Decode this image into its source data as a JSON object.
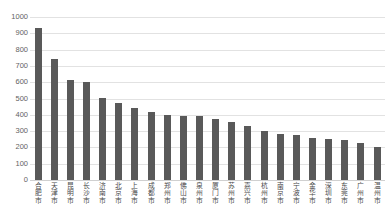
{
  "chart_data": {
    "type": "bar",
    "title": "",
    "subtitle": "",
    "xlabel": "",
    "ylabel": "",
    "ylim": [
      0,
      1000
    ],
    "grid": true,
    "legend": false,
    "legend_position": "none",
    "bar_color": "#595959",
    "gridline_color": "#e2e2e2",
    "yticks": [
      1000,
      900,
      800,
      700,
      600,
      500,
      400,
      300,
      200,
      100,
      0
    ],
    "ytick_labels": [
      "1000",
      "900",
      "800",
      "700",
      "600",
      "500",
      "400",
      "300",
      "200",
      "100",
      "0"
    ],
    "categories": [
      "合肥市",
      "天津市",
      "昆明市",
      "长沙市",
      "济南市",
      "北京市",
      "上海市",
      "成都市",
      "郑州市",
      "佛山市",
      "泉州市",
      "厦门市",
      "苏州市",
      "嘉兴市",
      "杭州市",
      "南京市",
      "宁波市",
      "金华市",
      "深圳市",
      "东莞市",
      "广州市",
      "温州市"
    ],
    "values": [
      935,
      745,
      612,
      600,
      505,
      470,
      440,
      420,
      400,
      395,
      390,
      375,
      355,
      330,
      300,
      285,
      275,
      260,
      250,
      245,
      225,
      200
    ]
  }
}
